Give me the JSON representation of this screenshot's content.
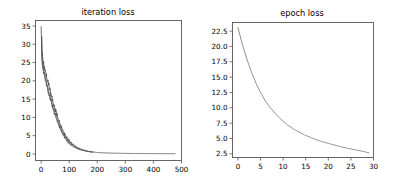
{
  "figure": {
    "background_color": "#ffffff",
    "line_color": "#4d4d4d",
    "axis_color": "#555555",
    "width": 394,
    "height": 188
  },
  "chart_data": [
    {
      "type": "line",
      "title": "iteration loss",
      "xlabel": "",
      "ylabel": "",
      "xlim": [
        -20,
        500
      ],
      "ylim": [
        -1.8,
        36.5
      ],
      "xticks": [
        0,
        100,
        200,
        300,
        400,
        500
      ],
      "yticks": [
        0,
        5,
        10,
        15,
        20,
        25,
        30,
        35
      ],
      "xtick_labels": [
        "0",
        "100",
        "200",
        "300",
        "400",
        "500"
      ],
      "ytick_labels": [
        "0",
        "5",
        "10",
        "15",
        "20",
        "25",
        "30",
        "35"
      ],
      "grid": false,
      "legend": false,
      "series": [
        {
          "name": "iteration loss",
          "x": [
            0,
            3,
            5,
            7,
            9,
            11,
            13,
            15,
            17,
            19,
            21,
            23,
            25,
            27,
            29,
            31,
            33,
            35,
            37,
            39,
            41,
            43,
            45,
            47,
            49,
            52,
            55,
            58,
            61,
            64,
            67,
            70,
            75,
            80,
            85,
            90,
            95,
            100,
            110,
            120,
            130,
            140,
            150,
            160,
            170,
            180,
            200,
            220,
            240,
            260,
            280,
            300,
            330,
            360,
            400,
            440,
            475
          ],
          "y": [
            34.8,
            26.5,
            24.8,
            23.5,
            23.0,
            22.4,
            21.6,
            20.8,
            20.4,
            19.6,
            19.0,
            18.4,
            17.8,
            17.2,
            16.6,
            16.0,
            15.6,
            15.2,
            14.6,
            13.8,
            13.2,
            12.6,
            12.2,
            11.6,
            11.4,
            10.8,
            10.0,
            9.3,
            8.6,
            8.0,
            7.4,
            6.9,
            6.0,
            5.2,
            4.6,
            4.0,
            3.5,
            3.1,
            2.4,
            1.9,
            1.5,
            1.2,
            1.0,
            0.8,
            0.65,
            0.55,
            0.4,
            0.3,
            0.24,
            0.2,
            0.17,
            0.15,
            0.12,
            0.1,
            0.08,
            0.07,
            0.06
          ],
          "noise_band": true,
          "noise_description": "thick jagged band of per-iteration values in the first ~170 iterations"
        }
      ]
    },
    {
      "type": "line",
      "title": "epoch loss",
      "xlabel": "",
      "ylabel": "",
      "xlim": [
        -1.2,
        30
      ],
      "ylim": [
        1.9,
        23.9
      ],
      "xticks": [
        0,
        5,
        10,
        15,
        20,
        25,
        30
      ],
      "yticks": [
        2.5,
        5.0,
        7.5,
        10.0,
        12.5,
        15.0,
        17.5,
        20.0,
        22.5
      ],
      "xtick_labels": [
        "0",
        "5",
        "10",
        "15",
        "20",
        "25",
        "30"
      ],
      "ytick_labels": [
        "2.5",
        "5.0",
        "7.5",
        "10.0",
        "12.5",
        "15.0",
        "17.5",
        "20.0",
        "22.5"
      ],
      "grid": false,
      "legend": false,
      "series": [
        {
          "name": "epoch loss",
          "x": [
            0,
            1,
            2,
            3,
            4,
            5,
            6,
            7,
            8,
            9,
            10,
            11,
            12,
            13,
            14,
            15,
            16,
            17,
            18,
            19,
            20,
            21,
            22,
            23,
            24,
            25,
            26,
            27,
            28,
            29
          ],
          "y": [
            23.1,
            20.3,
            17.9,
            15.8,
            14.0,
            12.5,
            11.2,
            10.15,
            9.3,
            8.5,
            7.8,
            7.2,
            6.7,
            6.25,
            5.85,
            5.5,
            5.2,
            4.9,
            4.65,
            4.4,
            4.2,
            4.0,
            3.8,
            3.62,
            3.45,
            3.3,
            3.15,
            3.0,
            2.85,
            2.65
          ]
        }
      ]
    }
  ]
}
